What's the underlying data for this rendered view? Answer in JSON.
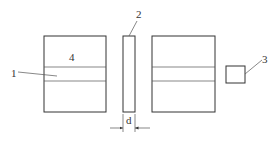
{
  "diagram": {
    "type": "schematic",
    "labels": {
      "part1": "1",
      "part2": "2",
      "part3": "3",
      "part4": "4",
      "dimension": "d"
    },
    "parts": [
      {
        "id": "1",
        "description": "middle band of left block"
      },
      {
        "id": "2",
        "description": "thin plate of thickness d"
      },
      {
        "id": "3",
        "description": "small square element"
      },
      {
        "id": "4",
        "description": "left block"
      }
    ],
    "colors": {
      "stroke": "#333333",
      "background": "#ffffff"
    }
  }
}
